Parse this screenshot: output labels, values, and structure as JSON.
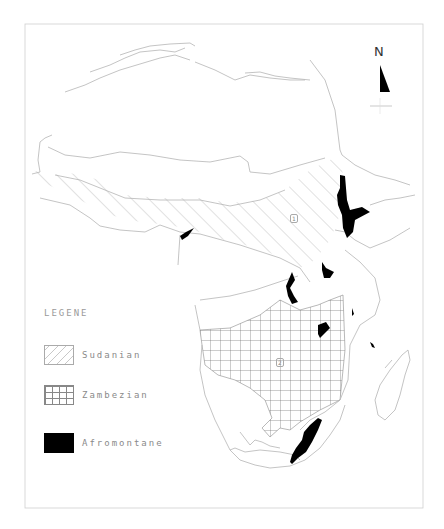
{
  "map": {
    "north_arrow": {
      "label": "N"
    },
    "zone_labels": [
      {
        "id": "1",
        "label": "1"
      },
      {
        "id": "2",
        "label": "2"
      }
    ],
    "legend": {
      "title": "LEGENE",
      "items": [
        {
          "label": "Sudanian",
          "pattern": "diagonal-hatch"
        },
        {
          "label": "Zambezian",
          "pattern": "grid"
        },
        {
          "label": "Afromontane",
          "pattern": "solid-black"
        }
      ]
    },
    "colors": {
      "outline": "#b0b0b0",
      "hatch": "#c4c4c4",
      "grid": "#707070",
      "afromontane": "#000000",
      "frame": "#c8c8c8"
    }
  }
}
